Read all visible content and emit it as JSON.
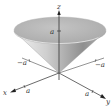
{
  "figure": {
    "type": "3d-surface-diagram",
    "surface": "cone",
    "colors": {
      "surface_light": "#e2e2e2",
      "surface_dark": "#8a8a8a",
      "axis": "#555555",
      "text": "#333333"
    }
  },
  "axes": {
    "z_label": "z",
    "x_label": "x",
    "y_label": "y",
    "z_tick": "a",
    "x_tick": "a",
    "y_tick": "a",
    "neg_x_tick": "−a",
    "neg_y_tick": "−a"
  }
}
